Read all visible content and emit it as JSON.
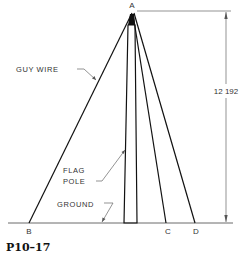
{
  "figure": {
    "id": "P10–17",
    "points": {
      "A": "A",
      "B": "B",
      "C": "C",
      "D": "D"
    },
    "labels": {
      "guy_wire": "GUY WIRE",
      "flag_pole_line1": "FLAG",
      "flag_pole_line2": "POLE",
      "ground": "GROUND"
    },
    "dimension": {
      "height": "12 192"
    }
  }
}
